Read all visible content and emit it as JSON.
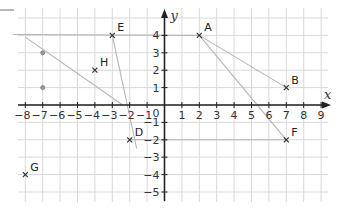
{
  "chart_data": {
    "type": "scatter",
    "title": "",
    "xlabel": "x",
    "ylabel": "y",
    "xlim": [
      -8.5,
      9.5
    ],
    "ylim": [
      -5.5,
      4.8
    ],
    "grid": true,
    "x_ticks": [
      -8,
      -7,
      -6,
      -5,
      -4,
      -3,
      -2,
      -1,
      1,
      2,
      3,
      4,
      5,
      6,
      7,
      8,
      9
    ],
    "y_ticks": [
      -5,
      -4,
      -3,
      -2,
      -1,
      1,
      2,
      3,
      4
    ],
    "origin_label": "0",
    "points": [
      {
        "name": "A",
        "x": 2,
        "y": 4
      },
      {
        "name": "B",
        "x": 7,
        "y": 1
      },
      {
        "name": "D",
        "x": -2,
        "y": -2
      },
      {
        "name": "E",
        "x": -3,
        "y": 4
      },
      {
        "name": "F",
        "x": 7,
        "y": -2
      },
      {
        "name": "G",
        "x": -8,
        "y": -4
      },
      {
        "name": "H",
        "x": -4,
        "y": 2
      }
    ],
    "pencil_lines": [
      {
        "from": [
          -8.7,
          4.05
        ],
        "to": [
          2,
          4
        ]
      },
      {
        "from": [
          -3,
          4
        ],
        "to": [
          -1.6,
          -2.5
        ]
      },
      {
        "from": [
          -8,
          3.9
        ],
        "to": [
          -2.4,
          0
        ]
      },
      {
        "from": [
          2,
          4
        ],
        "to": [
          7,
          -2
        ]
      },
      {
        "from": [
          2,
          4
        ],
        "to": [
          7,
          1
        ]
      },
      {
        "from": [
          -2,
          -2
        ],
        "to": [
          7,
          -2
        ]
      }
    ],
    "pencil_dots": [
      {
        "x": -7,
        "y": 3
      },
      {
        "x": -7,
        "y": 1
      },
      {
        "x": -2,
        "y": 6.4
      }
    ]
  },
  "colors": {
    "grid": "#d9d9d9",
    "axis": "#222222",
    "pencil": "#b5b5b5",
    "marker": "#333333"
  },
  "geometry": {
    "origin_px": [
      164.5,
      105
    ],
    "unit_px": 17.4,
    "grid_left": 18,
    "grid_right": 328,
    "grid_top": 8,
    "grid_bottom": 202
  }
}
